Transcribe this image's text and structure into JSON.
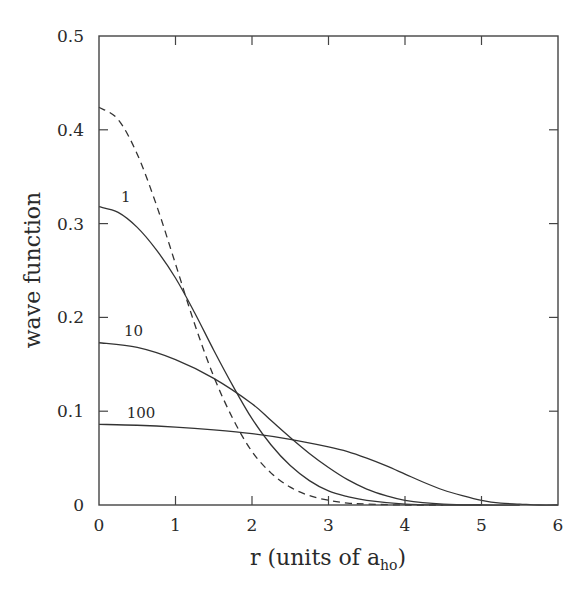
{
  "chart_data": {
    "type": "line",
    "title": "",
    "xlabel": "r (units of a",
    "xlabel_subscript": "ho",
    "xlabel_suffix": ")",
    "ylabel": "wave function",
    "xlim": [
      0,
      6
    ],
    "ylim": [
      0,
      0.5
    ],
    "grid": false,
    "legend": "none (curves labeled inline)",
    "x_ticks": [
      0,
      1,
      2,
      3,
      4,
      5,
      6
    ],
    "x_tick_labels": [
      "0",
      "1",
      "2",
      "3",
      "4",
      "5",
      "6"
    ],
    "y_ticks": [
      0,
      0.1,
      0.2,
      0.3,
      0.4,
      0.5
    ],
    "y_tick_labels": [
      "0",
      "0.1",
      "0.2",
      "0.3",
      "0.4",
      "0.5"
    ],
    "series": [
      {
        "name": "non-interacting (Gaussian)",
        "label": "",
        "style": "dashed",
        "x": [
          0,
          0.25,
          0.5,
          0.75,
          1,
          1.25,
          1.5,
          1.75,
          2,
          2.25,
          2.5,
          2.75,
          3,
          3.25,
          3.5,
          4,
          4.5
        ],
        "values": [
          0.424,
          0.411,
          0.374,
          0.32,
          0.257,
          0.193,
          0.137,
          0.092,
          0.057,
          0.034,
          0.019,
          0.01,
          0.005,
          0.002,
          0.001,
          0.0,
          0.0
        ]
      },
      {
        "name": "1",
        "label": "1",
        "style": "solid",
        "x": [
          0,
          0.25,
          0.5,
          0.75,
          1,
          1.25,
          1.5,
          1.75,
          2,
          2.25,
          2.5,
          2.75,
          3,
          3.25,
          3.5,
          4,
          4.5,
          5
        ],
        "values": [
          0.318,
          0.312,
          0.296,
          0.272,
          0.242,
          0.205,
          0.165,
          0.127,
          0.092,
          0.064,
          0.042,
          0.026,
          0.015,
          0.009,
          0.005,
          0.001,
          0.0,
          0.0
        ]
      },
      {
        "name": "10",
        "label": "10",
        "style": "solid",
        "x": [
          0,
          0.5,
          1,
          1.5,
          2,
          2.25,
          2.5,
          2.75,
          3,
          3.25,
          3.5,
          3.75,
          4,
          4.5,
          5,
          5.5
        ],
        "values": [
          0.173,
          0.168,
          0.155,
          0.135,
          0.108,
          0.09,
          0.072,
          0.055,
          0.04,
          0.027,
          0.017,
          0.01,
          0.005,
          0.001,
          0.0,
          0.0
        ]
      },
      {
        "name": "100",
        "label": "100",
        "style": "solid",
        "x": [
          0,
          0.5,
          1,
          1.5,
          2,
          2.5,
          3,
          3.25,
          3.5,
          3.75,
          4,
          4.25,
          4.5,
          4.75,
          5,
          5.25,
          5.5,
          5.75,
          6
        ],
        "values": [
          0.086,
          0.085,
          0.083,
          0.08,
          0.076,
          0.07,
          0.062,
          0.057,
          0.05,
          0.042,
          0.033,
          0.024,
          0.016,
          0.01,
          0.005,
          0.002,
          0.001,
          0.0,
          0.0
        ]
      }
    ],
    "annotations": [
      {
        "text": "1",
        "x": 0.35,
        "y": 0.323
      },
      {
        "text": "10",
        "x": 0.45,
        "y": 0.18
      },
      {
        "text": "100",
        "x": 0.55,
        "y": 0.093
      }
    ]
  }
}
